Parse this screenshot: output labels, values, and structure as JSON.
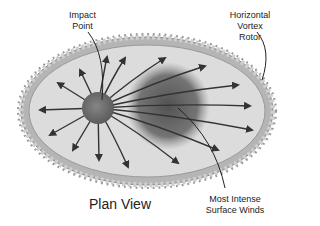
{
  "diagram": {
    "title": "Plan View",
    "labels": {
      "impact_point": [
        "Impact",
        "Point"
      ],
      "vortex_rotor": [
        "Horizontal",
        "Vortex",
        "Rotor"
      ],
      "intense_winds": [
        "Most Intense",
        "Surface Winds"
      ]
    },
    "colors": {
      "ring": "#a8a8a8",
      "ring_bead": "#c8c8c8",
      "fill": "#dcdcdc",
      "impact": "#6e6e6e",
      "blob": "#5a5a5a",
      "arrow": "#333333"
    },
    "arrows": [
      {
        "x": 40,
        "y": 110
      },
      {
        "x": 58,
        "y": 83
      },
      {
        "x": 80,
        "y": 70
      },
      {
        "x": 107,
        "y": 57
      },
      {
        "x": 125,
        "y": 58
      },
      {
        "x": 165,
        "y": 58
      },
      {
        "x": 205,
        "y": 66
      },
      {
        "x": 238,
        "y": 85
      },
      {
        "x": 250,
        "y": 106
      },
      {
        "x": 252,
        "y": 130
      },
      {
        "x": 218,
        "y": 150
      },
      {
        "x": 178,
        "y": 163
      },
      {
        "x": 128,
        "y": 167
      },
      {
        "x": 99,
        "y": 160
      },
      {
        "x": 73,
        "y": 150
      },
      {
        "x": 50,
        "y": 135
      }
    ]
  }
}
